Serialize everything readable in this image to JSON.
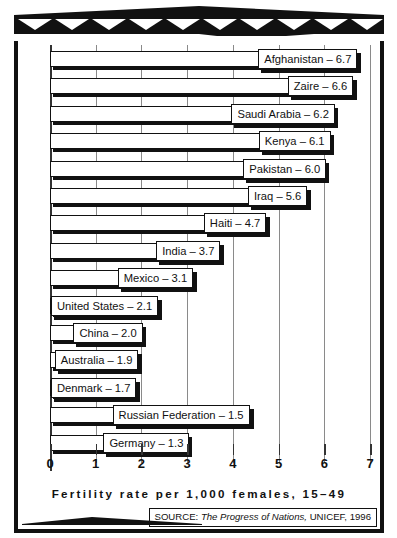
{
  "chart_data": {
    "type": "bar",
    "orientation": "horizontal",
    "title": "",
    "xlabel": "Fertility rate per 1,000 females, 15–49",
    "ylabel": "",
    "xlim": [
      0,
      7
    ],
    "xticks": [
      0,
      1,
      2,
      3,
      4,
      5,
      6,
      7
    ],
    "xtick_labels": [
      "0",
      "1",
      "2",
      "3",
      "4",
      "5",
      "6",
      "7"
    ],
    "grid": true,
    "legend": "none",
    "categories": [
      "Afghanistan",
      "Zaire",
      "Saudi Arabia",
      "Kenya",
      "Pakistan",
      "Iraq",
      "Haiti",
      "India",
      "Mexico",
      "United States",
      "China",
      "Australia",
      "Denmark",
      "Russian Federation",
      "Germany"
    ],
    "values": [
      6.7,
      6.6,
      6.2,
      6.1,
      6.0,
      5.6,
      4.7,
      3.7,
      3.1,
      2.1,
      2.0,
      1.9,
      1.7,
      1.5,
      1.3
    ],
    "bars": [
      {
        "label": "Afghanistan – 6.7",
        "value": 6.7,
        "label_inside": true
      },
      {
        "label": "Zaire – 6.6",
        "value": 6.6,
        "label_inside": true
      },
      {
        "label": "Saudi Arabia – 6.2",
        "value": 6.2,
        "label_inside": true
      },
      {
        "label": "Kenya – 6.1",
        "value": 6.1,
        "label_inside": true
      },
      {
        "label": "Pakistan – 6.0",
        "value": 6.0,
        "label_inside": true
      },
      {
        "label": "Iraq – 5.6",
        "value": 5.6,
        "label_inside": true
      },
      {
        "label": "Haiti – 4.7",
        "value": 4.7,
        "label_inside": true
      },
      {
        "label": "India – 3.7",
        "value": 3.7,
        "label_inside": true
      },
      {
        "label": "Mexico – 3.1",
        "value": 3.1,
        "label_inside": true
      },
      {
        "label": "United States – 2.1",
        "value": 2.1,
        "label_inside": true
      },
      {
        "label": "China – 2.0",
        "value": 2.0,
        "label_inside": true
      },
      {
        "label": "Australia – 1.9",
        "value": 1.9,
        "label_inside": true
      },
      {
        "label": "Denmark – 1.7",
        "value": 1.7,
        "label_inside": true
      },
      {
        "label": "Russian Federation – 1.5",
        "value": 1.5,
        "label_inside": false
      },
      {
        "label": "Germany – 1.3",
        "value": 1.3,
        "label_inside": false
      }
    ]
  },
  "footer": {
    "source_prefix": "SOURCE: ",
    "source_title": "The Progress of Nations,",
    "source_rest": " UNICEF, 1996"
  },
  "colors": {
    "ink": "#111111",
    "paper": "#ffffff",
    "grid": "#8a8a8a"
  }
}
